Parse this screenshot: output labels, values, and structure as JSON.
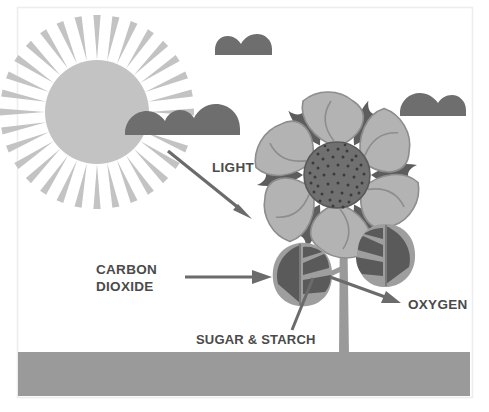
{
  "diagram": {
    "background_color": "#ffffff",
    "frame_color": "#ededed"
  },
  "labels": {
    "light": "LIGHT",
    "carbon_dioxide_line1": "CARBON",
    "carbon_dioxide_line2": "DIOXIDE",
    "oxygen": "OXYGEN",
    "sugar_starch": "SUGAR & STARCH"
  },
  "colors": {
    "sun": "#c3c3c3",
    "sun_rays": "#c3c3c3",
    "cloud": "#6e6e6e",
    "ground": "#9a9a9a",
    "petal_light": "#b3b3b3",
    "petal_dark": "#5d5d5d",
    "flower_center": "#707070",
    "flower_center_dots": "#3b3b3b",
    "leaf_light": "#9e9e9e",
    "leaf_dark": "#5a5a5a",
    "stem": "#9a9a9a",
    "arrow": "#6b6b6b",
    "text": "#4a4a4a"
  },
  "elements": {
    "sun_name": "sun",
    "sun_ray_count": 32,
    "cloud_count": 3,
    "petal_count": 6,
    "leaf_count": 2,
    "arrow_count": 3,
    "pointer_count": 1
  }
}
